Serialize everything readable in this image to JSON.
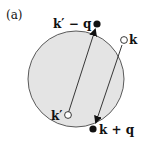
{
  "panel_label": "(a)",
  "points": {
    "k_minus_q": {
      "label": "k′ − q",
      "marker": "filled"
    },
    "k": {
      "label": "k",
      "marker": "open"
    },
    "k_prime": {
      "label": "k′",
      "marker": "open"
    },
    "k_plus_q": {
      "label": "k + q",
      "marker": "filled"
    }
  },
  "colors": {
    "disk_fill": "#e4e4e4",
    "stroke": "#222222"
  }
}
